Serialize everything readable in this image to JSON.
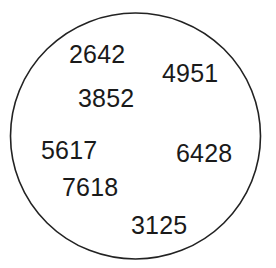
{
  "figure": {
    "type": "number-circle-diagram",
    "background_color": "#ffffff",
    "shape": {
      "name": "circle-outline",
      "stroke_color": "#222222",
      "fill_color": "#ffffff",
      "stroke_width": 1.6,
      "center_x": 135.5,
      "center_y": 136,
      "radius_x": 125,
      "radius_y": 123
    },
    "text_color": "#1a1a1a",
    "font_size_px": 25,
    "numbers": [
      {
        "value": "2642",
        "x": 69,
        "y": 42
      },
      {
        "value": "4951",
        "x": 162,
        "y": 61
      },
      {
        "value": "3852",
        "x": 78,
        "y": 86
      },
      {
        "value": "5617",
        "x": 41,
        "y": 138
      },
      {
        "value": "6428",
        "x": 176,
        "y": 141
      },
      {
        "value": "7618",
        "x": 62,
        "y": 175
      },
      {
        "value": "3125",
        "x": 131,
        "y": 213
      }
    ]
  }
}
